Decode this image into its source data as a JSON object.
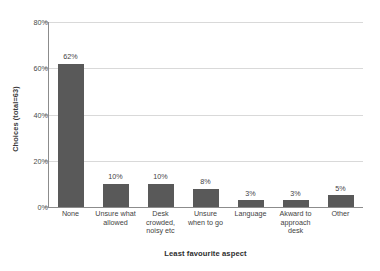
{
  "chart_data": {
    "type": "bar",
    "title": "",
    "subtitle": "",
    "xlabel": "Least favourite aspect",
    "ylabel": "Choices (total=63)",
    "categories": [
      "None",
      "Unsure what allowed",
      "Desk crowded, noisy etc",
      "Unsure when to go",
      "Language",
      "Akward to approach desk",
      "Other"
    ],
    "category_lines": [
      [
        "None"
      ],
      [
        "Unsure what",
        "allowed"
      ],
      [
        "Desk",
        "crowded,",
        "noisy etc"
      ],
      [
        "Unsure",
        "when to go"
      ],
      [
        "Language"
      ],
      [
        "Akward to",
        "approach",
        "desk"
      ],
      [
        "Other"
      ]
    ],
    "values": [
      62,
      10,
      10,
      8,
      3,
      3,
      5
    ],
    "data_labels": [
      "62%",
      "10%",
      "10%",
      "8%",
      "3%",
      "3%",
      "5%"
    ],
    "ylim": [
      0,
      80
    ],
    "yticks": [
      0,
      20,
      40,
      60,
      80
    ],
    "ytick_labels": [
      "0%",
      "20%",
      "40%",
      "60%",
      "80%"
    ],
    "grid": true,
    "grid_axis": "y",
    "legend": false,
    "legend_position": "none",
    "colors": {
      "bar": "#595959",
      "gridline": "#d9d9d9",
      "axis": "#8c8c8c",
      "text": "#3f3f3f",
      "background": "#ffffff"
    }
  }
}
